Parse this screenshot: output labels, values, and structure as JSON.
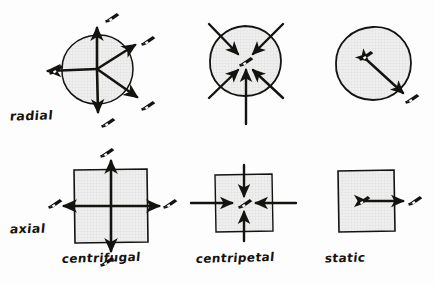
{
  "figure": {
    "background_color": "#fdfdfd",
    "ink_color": "#15130f",
    "fill_texture": "fine graph-paper grid",
    "fill_color": "#eeeeee",
    "grid_line_color": "#cfcfcf"
  },
  "row_labels": [
    {
      "id": "radial",
      "label": "radial"
    },
    {
      "id": "axial",
      "label": "axial"
    }
  ],
  "column_labels": [
    {
      "id": "centrifugal",
      "label": "centrifugal"
    },
    {
      "id": "centripetal",
      "label": "centripetal"
    },
    {
      "id": "static",
      "label": "static"
    }
  ],
  "icons": {
    "camera": "camera-icon",
    "arrow": "arrow-icon"
  },
  "cells": [
    {
      "id": "radial-centrifugal",
      "row": "radial",
      "column": "centrifugal",
      "shape": "circle",
      "arrow_direction": "outward",
      "arrow_count": 5,
      "arrow_bearings_deg": [
        0,
        45,
        135,
        180,
        270
      ],
      "camera_count": 5,
      "camera_position": "arrow tips, outside shape"
    },
    {
      "id": "radial-centripetal",
      "row": "radial",
      "column": "centripetal",
      "shape": "circle",
      "arrow_direction": "inward",
      "arrow_count": 5,
      "arrow_bearings_deg": [
        45,
        135,
        225,
        270,
        315
      ],
      "camera_count": 1,
      "camera_position": "center of shape"
    },
    {
      "id": "radial-static",
      "row": "radial",
      "column": "static",
      "shape": "circle",
      "arrow_direction": "double-headed diagonal",
      "arrow_count": 1,
      "arrow_bearings_deg": [
        315
      ],
      "camera_count": 2,
      "camera_position": "one inside, one outside"
    },
    {
      "id": "axial-centrifugal",
      "row": "axial",
      "column": "centrifugal",
      "shape": "square",
      "arrow_direction": "outward",
      "arrow_count": 4,
      "arrow_bearings_deg": [
        0,
        90,
        180,
        270
      ],
      "camera_count": 4,
      "camera_position": "arrow tips, outside shape"
    },
    {
      "id": "axial-centripetal",
      "row": "axial",
      "column": "centripetal",
      "shape": "square",
      "arrow_direction": "inward",
      "arrow_count": 4,
      "arrow_bearings_deg": [
        0,
        90,
        180,
        270
      ],
      "camera_count": 1,
      "camera_position": "center of shape"
    },
    {
      "id": "axial-static",
      "row": "axial",
      "column": "static",
      "shape": "square",
      "arrow_direction": "double-headed horizontal",
      "arrow_count": 1,
      "arrow_bearings_deg": [
        0
      ],
      "camera_count": 2,
      "camera_position": "one inside, one outside"
    }
  ]
}
